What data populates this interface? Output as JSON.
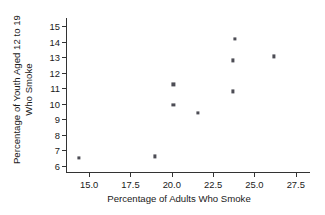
{
  "chart_data": {
    "type": "scatter",
    "title": "",
    "xlabel": "Percentage of Adults Who Smoke",
    "ylabel_line1": "Percentage of Youth Aged 12 to 19",
    "ylabel_line2": "Who Smoke",
    "xlim": [
      13.6,
      28.3
    ],
    "ylim": [
      5.6,
      15.4
    ],
    "xticks": [
      15.0,
      17.5,
      20.0,
      22.5,
      25.0,
      27.5
    ],
    "xtick_labels": [
      "15.0",
      "17.5",
      "20.0",
      "22.5",
      "25.0",
      "27.5"
    ],
    "yticks": [
      6,
      7,
      8,
      9,
      10,
      11,
      12,
      13,
      14,
      15
    ],
    "ytick_labels": [
      "6",
      "7",
      "8",
      "9",
      "10",
      "11",
      "12",
      "13",
      "14",
      "15"
    ],
    "grid": false,
    "legend": null,
    "marker": "square",
    "marker_color": "#4d4d55",
    "axis_color": "#333333",
    "points": [
      {
        "x": 14.4,
        "y": 6.5
      },
      {
        "x": 19.0,
        "y": 6.6
      },
      {
        "x": 20.1,
        "y": 9.9
      },
      {
        "x": 20.1,
        "y": 11.25
      },
      {
        "x": 21.6,
        "y": 9.4
      },
      {
        "x": 23.7,
        "y": 10.8
      },
      {
        "x": 23.7,
        "y": 12.8
      },
      {
        "x": 23.8,
        "y": 14.2
      },
      {
        "x": 26.2,
        "y": 13.05
      }
    ]
  }
}
